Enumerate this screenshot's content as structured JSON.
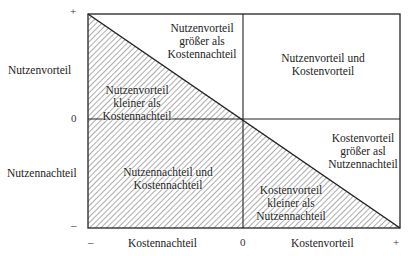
{
  "diagram": {
    "y_axis": {
      "label_positive": "Nutzenvorteil",
      "label_negative": "Nutzennachteil",
      "tick_top": "+",
      "tick_middle": "0",
      "tick_bottom": "–"
    },
    "x_axis": {
      "label_negative": "Kostennachteil",
      "label_positive": "Kostenvorteil",
      "tick_left": "–",
      "tick_middle": "0",
      "tick_right": "+"
    },
    "regions": {
      "top_left_upper": [
        "Nutzenvorteil",
        "größer als",
        "Kostennachteil"
      ],
      "top_left_lower": [
        "Nutzenvorteil",
        "kleiner als",
        "Kostennachteil"
      ],
      "top_right": [
        "Nutzenvorteil und",
        "Kostenvorteil"
      ],
      "bottom_left": [
        "Nutzennachteil und",
        "Kostennachteil"
      ],
      "bottom_right_upper": [
        "Kostenvorteil",
        "größer asl",
        "Nutzennachteil"
      ],
      "bottom_right_lower": [
        "Kostenvorteil",
        "kleiner als",
        "Nutzennachteil"
      ]
    },
    "colors": {
      "line": "#222222",
      "hatch": "#555555",
      "background": "#ffffff"
    }
  }
}
